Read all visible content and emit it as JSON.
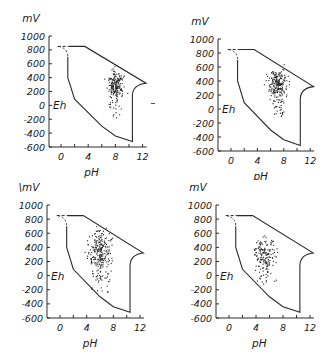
{
  "figure": {
    "panel_labels": [
      "top-left",
      "top-right",
      "bottom-left",
      "bottom-right"
    ]
  },
  "axes": {
    "y_unit": "mV",
    "y_unit_bottom_left": "\\mV",
    "y_inner_label": "Eh",
    "x_label": "pH",
    "y_ticks": [
      "1000",
      "800",
      "600",
      "400",
      "200",
      "0",
      "-200",
      "-400",
      "-600"
    ],
    "x_ticks": [
      "0",
      "4",
      "8",
      "12"
    ]
  },
  "chart_data": [
    {
      "type": "scatter",
      "title": "",
      "xlabel": "pH",
      "ylabel": "mV (Eh)",
      "xlim": [
        -1.8,
        12.5
      ],
      "ylim": [
        -600,
        1000
      ],
      "x_ticks": [
        0,
        4,
        8,
        12
      ],
      "y_ticks": [
        1000,
        800,
        600,
        400,
        200,
        0,
        -200,
        -400,
        -600
      ],
      "grid": false,
      "boundary": [
        [
          -0.5,
          850
        ],
        [
          3.5,
          850
        ],
        [
          12.5,
          320
        ],
        [
          11,
          260
        ],
        [
          10.5,
          150
        ],
        [
          10.5,
          -520
        ],
        [
          8,
          -440
        ],
        [
          6,
          -300
        ],
        [
          2,
          90
        ],
        [
          1,
          400
        ],
        [
          1,
          700
        ],
        [
          0.3,
          820
        ],
        [
          -0.5,
          850
        ]
      ],
      "cluster": {
        "center_pH": 8.0,
        "center_mV": 300,
        "spread_pH": 0.9,
        "spread_mV": 180,
        "tail_to_mV": -180,
        "n": 200
      },
      "notes": "Dense cluster around pH 7.5-8.5, Eh 200-400 mV with sparse points down to -150 mV"
    },
    {
      "type": "scatter",
      "title": "",
      "xlabel": "pH",
      "ylabel": "mV (Eh)",
      "xlim": [
        -1.8,
        12.5
      ],
      "ylim": [
        -600,
        1000
      ],
      "x_ticks": [
        0,
        4,
        8,
        12
      ],
      "y_ticks": [
        1000,
        800,
        600,
        400,
        200,
        0,
        -200,
        -400,
        -600
      ],
      "grid": false,
      "boundary": [
        [
          -0.5,
          850
        ],
        [
          3.5,
          850
        ],
        [
          12.5,
          320
        ],
        [
          11,
          260
        ],
        [
          10.5,
          150
        ],
        [
          10.5,
          -520
        ],
        [
          8,
          -440
        ],
        [
          6,
          -300
        ],
        [
          2,
          90
        ],
        [
          1,
          400
        ],
        [
          1,
          700
        ],
        [
          0.3,
          820
        ],
        [
          -0.5,
          850
        ]
      ],
      "cluster": {
        "center_pH": 7.0,
        "center_mV": 370,
        "spread_pH": 1.1,
        "spread_mV": 150,
        "tail_to_mV": -100,
        "n": 230
      },
      "notes": "Cluster around pH 6-8, Eh 200-500 mV"
    },
    {
      "type": "scatter",
      "title": "",
      "xlabel": "pH",
      "ylabel": "mV (Eh)",
      "xlim": [
        -1.8,
        12.5
      ],
      "ylim": [
        -600,
        1000
      ],
      "x_ticks": [
        0,
        4,
        8,
        12
      ],
      "y_ticks": [
        1000,
        800,
        600,
        400,
        200,
        0,
        -200,
        -400,
        -600
      ],
      "grid": false,
      "boundary": [
        [
          -0.5,
          850
        ],
        [
          3.5,
          850
        ],
        [
          12.5,
          320
        ],
        [
          11,
          260
        ],
        [
          10.5,
          150
        ],
        [
          10.5,
          -520
        ],
        [
          8,
          -440
        ],
        [
          6,
          -300
        ],
        [
          2,
          90
        ],
        [
          1,
          400
        ],
        [
          1,
          700
        ],
        [
          0.3,
          820
        ],
        [
          -0.5,
          850
        ]
      ],
      "cluster": {
        "center_pH": 6.0,
        "center_mV": 350,
        "spread_pH": 1.4,
        "spread_mV": 260,
        "tail_to_mV": -280,
        "n": 260
      },
      "notes": "Broad band from pH 4-9, Eh 600 to -300 mV"
    },
    {
      "type": "scatter",
      "title": "",
      "xlabel": "pH",
      "ylabel": "mV (Eh)",
      "xlim": [
        -1.8,
        12.5
      ],
      "ylim": [
        -600,
        1000
      ],
      "x_ticks": [
        0,
        4,
        8,
        12
      ],
      "y_ticks": [
        1000,
        800,
        600,
        400,
        200,
        0,
        -200,
        -400,
        -600
      ],
      "grid": false,
      "boundary": [
        [
          -0.5,
          850
        ],
        [
          3.5,
          850
        ],
        [
          12.5,
          320
        ],
        [
          11,
          260
        ],
        [
          10.5,
          150
        ],
        [
          10.5,
          -520
        ],
        [
          8,
          -440
        ],
        [
          6,
          -300
        ],
        [
          2,
          90
        ],
        [
          1,
          400
        ],
        [
          1,
          700
        ],
        [
          0.3,
          820
        ],
        [
          -0.5,
          850
        ]
      ],
      "cluster": {
        "center_pH": 5.2,
        "center_mV": 330,
        "spread_pH": 1.3,
        "spread_mV": 170,
        "tail_to_mV": -150,
        "n": 170
      },
      "notes": "Cluster around pH 3.5-8, Eh 100-600 mV, scattered points near -100 mV"
    }
  ]
}
